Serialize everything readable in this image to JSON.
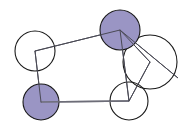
{
  "figure": {
    "title": "",
    "background_color": "#ffffff",
    "width": 192,
    "height": 130
  },
  "style": {
    "node_fill_filled": "#9a95c4",
    "node_fill_empty": "#ffffff",
    "node_stroke": "#1a1a1a",
    "node_stroke_width": 1.1,
    "edge_stroke": "#4a4a55",
    "edge_stroke_width": 1.0,
    "vertex_marker_stroke": "#4a4a55"
  },
  "chart_data": {
    "type": "diagram",
    "diagram_kind": "node-link-graph",
    "title": "",
    "nodes": [
      {
        "id": "n1",
        "label": "",
        "state": "empty",
        "fill": "#ffffff",
        "cx": 35,
        "cy": 51,
        "r": 20
      },
      {
        "id": "n2",
        "label": "",
        "state": "filled",
        "fill": "#9a95c4",
        "cx": 120,
        "cy": 30,
        "r": 20
      },
      {
        "id": "n3",
        "label": "",
        "state": "empty",
        "fill": "#ffffff",
        "cx": 150,
        "cy": 62,
        "r": 27
      },
      {
        "id": "n4",
        "label": "",
        "state": "filled",
        "fill": "#9a95c4",
        "cx": 41,
        "cy": 102,
        "r": 18
      },
      {
        "id": "n5",
        "label": "",
        "state": "empty",
        "fill": "#ffffff",
        "cx": 129,
        "cy": 101,
        "r": 19
      }
    ],
    "edges": [
      {
        "id": "e1",
        "source": "n1",
        "target": "n2",
        "path": [
          [
            35,
            51
          ],
          [
            120,
            30
          ]
        ]
      },
      {
        "id": "e2",
        "source": "n1",
        "target": "n4",
        "path": [
          [
            35,
            51
          ],
          [
            41,
            102
          ]
        ]
      },
      {
        "id": "e3",
        "source": "n4",
        "target": "n5",
        "path": [
          [
            41,
            102
          ],
          [
            129,
            101
          ]
        ]
      },
      {
        "id": "e4",
        "source": "n2",
        "target": "n3",
        "path": [
          [
            120,
            30
          ],
          [
            150,
            62
          ]
        ]
      },
      {
        "id": "e5",
        "source": "n3",
        "target": "n5",
        "path": [
          [
            150,
            62
          ],
          [
            129,
            101
          ]
        ]
      },
      {
        "id": "e6",
        "source": "n2",
        "target": "n5",
        "path": [
          [
            120,
            30
          ],
          [
            129,
            101
          ]
        ]
      },
      {
        "id": "e7",
        "source": "n2",
        "target": "n3_edge_low",
        "path": [
          [
            120,
            30
          ],
          [
            178,
            78
          ]
        ]
      }
    ],
    "legend": [],
    "annotations": []
  }
}
